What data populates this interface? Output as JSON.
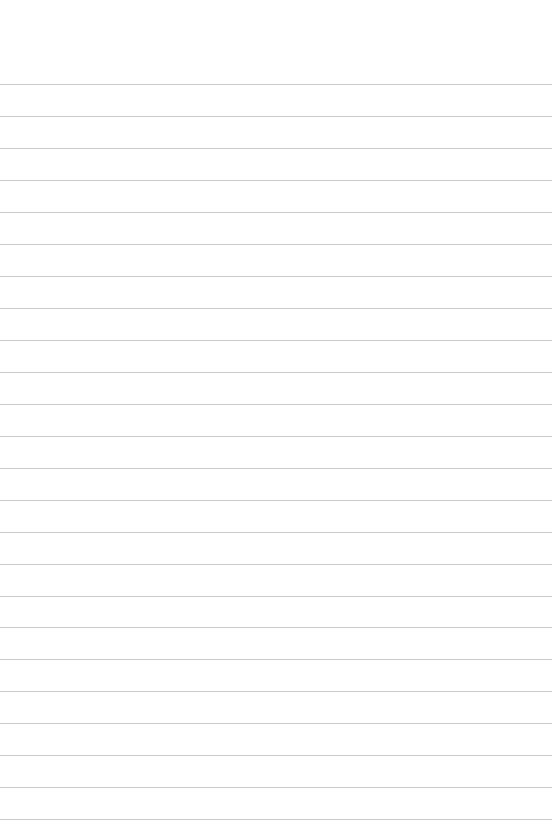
{
  "document": {
    "type": "blank lined paper",
    "text": "",
    "line_count": 24,
    "first_line_y": 84,
    "line_pitch": 32,
    "line_color": "#c9c9c9",
    "background_color": "#ffffff"
  }
}
